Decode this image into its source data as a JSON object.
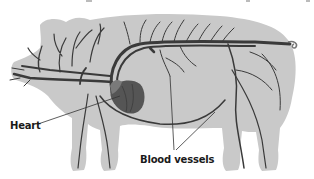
{
  "figure": {
    "labels": {
      "heart": "Heart",
      "blood_vessels": "Blood vessels"
    },
    "colors": {
      "background": "#ffffff",
      "body_silhouette": "#c9c9c9",
      "vessels": "#3a3a3a",
      "heart": "#555555",
      "label_text": "#1a1a1a",
      "leader_lines": "#333333"
    }
  }
}
